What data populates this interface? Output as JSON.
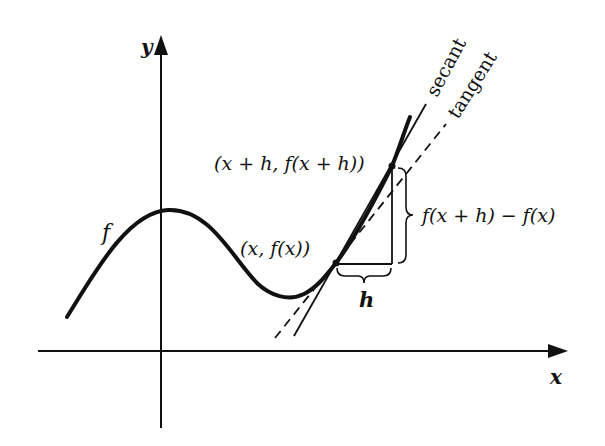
{
  "figure": {
    "axes": {
      "x_label": "x",
      "y_label": "y"
    },
    "curve": {
      "label": "f"
    },
    "points": {
      "p": {
        "label": "(x, f(x))"
      },
      "q": {
        "label": "(x + h, f(x + h))"
      }
    },
    "lines": {
      "secant": {
        "label": "secant",
        "style": "solid"
      },
      "tangent": {
        "label": "tangent",
        "style": "dashed"
      }
    },
    "braces": {
      "horizontal": {
        "label": "h"
      },
      "vertical": {
        "label": "f(x + h) − f(x)"
      }
    },
    "colors": {
      "ink": "#111111",
      "background": "#ffffff"
    }
  }
}
